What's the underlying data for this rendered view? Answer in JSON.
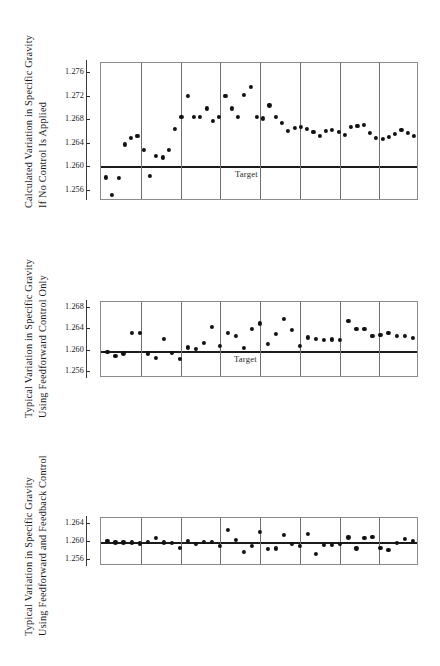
{
  "figure": {
    "background": "#ffffff",
    "ink": "#111111",
    "frame_color": "#8b8b8b",
    "panel_divider_color": "#6e6e6e",
    "target_line_color": "#1b1b1b"
  },
  "charts": [
    {
      "id": "chart-no-control",
      "axis_label_line1": "Calculated Variation in Specific Gravity",
      "axis_label_line2": "If No Control Is Applied",
      "target_label": "Target",
      "ticks": [
        "1.276",
        "1.272",
        "1.268",
        "1.264",
        "1.260",
        "1.256"
      ],
      "chart_data": {
        "type": "scatter",
        "title": "",
        "xlabel": "",
        "ylabel": "Calculated Variation in Specific Gravity If No Control Is Applied",
        "ylim": [
          1.2543,
          1.2777
        ],
        "yticks": [
          1.276,
          1.272,
          1.268,
          1.264,
          1.26,
          1.256
        ],
        "grid": false,
        "legend": "none",
        "panels": 8,
        "target": 1.26,
        "annotations": [
          "Target"
        ],
        "x": [
          1,
          2,
          3,
          4,
          5,
          6,
          7,
          8,
          9,
          10,
          11,
          12,
          13,
          14,
          15,
          16,
          17,
          18,
          19,
          20,
          21,
          22,
          23,
          24,
          25,
          26,
          27,
          28,
          29,
          30,
          31,
          32,
          33,
          34,
          35,
          36,
          37,
          38,
          39,
          40,
          41,
          42,
          43,
          44,
          45,
          46,
          47,
          48,
          49,
          50
        ],
        "values": [
          1.2583,
          1.2553,
          1.2582,
          1.2639,
          1.265,
          1.2654,
          1.263,
          1.2585,
          1.2619,
          1.2617,
          1.263,
          1.2665,
          1.2686,
          1.2721,
          1.2685,
          1.2686,
          1.27,
          1.2679,
          1.2686,
          1.2721,
          1.27,
          1.2685,
          1.2723,
          1.2737,
          1.2686,
          1.2683,
          1.2705,
          1.2685,
          1.2675,
          1.2662,
          1.2667,
          1.2668,
          1.2665,
          1.266,
          1.2653,
          1.2662,
          1.2663,
          1.266,
          1.2655,
          1.2668,
          1.267,
          1.2672,
          1.2658,
          1.265,
          1.2648,
          1.2652,
          1.2657,
          1.2664,
          1.2659,
          1.2654
        ]
      }
    },
    {
      "id": "chart-feedforward-only",
      "axis_label_line1": "Typical Variation in Specific Gravity",
      "axis_label_line2": "Using Feedforward Control Only",
      "target_label": "Target",
      "ticks": [
        "1.268",
        "1.264",
        "1.260",
        "1.256"
      ],
      "chart_data": {
        "type": "scatter",
        "title": "",
        "xlabel": "",
        "ylabel": "Typical Variation in Specific Gravity Using Feedforward Control Only",
        "ylim": [
          1.2549,
          1.2691
        ],
        "yticks": [
          1.268,
          1.264,
          1.26,
          1.256
        ],
        "grid": false,
        "legend": "none",
        "panels": 8,
        "target": 1.2597,
        "annotations": [
          "Target"
        ],
        "x": [
          1,
          2,
          3,
          4,
          5,
          6,
          7,
          8,
          9,
          10,
          11,
          12,
          13,
          14,
          15,
          16,
          17,
          18,
          19,
          20,
          21,
          22,
          23,
          24,
          25,
          26,
          27,
          28,
          29,
          30,
          31,
          32,
          33,
          34,
          35,
          36,
          37,
          38,
          39,
          40,
          41,
          42,
          43,
          44,
          45,
          46,
          47,
          48,
          49,
          50
        ],
        "values": [
          1.2597,
          1.2591,
          1.2595,
          1.2633,
          1.2634,
          1.2595,
          1.2587,
          1.2622,
          1.2596,
          1.2584,
          1.2606,
          1.2604,
          1.2615,
          1.2645,
          1.2609,
          1.2633,
          1.2627,
          1.2605,
          1.264,
          1.2651,
          1.2613,
          1.2632,
          1.266,
          1.2639,
          1.2609,
          1.2625,
          1.2622,
          1.262,
          1.2621,
          1.262,
          1.2655,
          1.264,
          1.264,
          1.2627,
          1.2629,
          1.2633,
          1.2628,
          1.2627,
          1.2624
        ]
      }
    },
    {
      "id": "chart-feedforward-feedback",
      "axis_label_line1": "Typical Variation in Specific Gravity",
      "axis_label_line2": "Using Feedforward and Feedback Control",
      "target_label": "",
      "ticks": [
        "1.264",
        "1.260",
        "1.256"
      ],
      "chart_data": {
        "type": "scatter",
        "title": "",
        "xlabel": "",
        "ylabel": "Typical Variation in Specific Gravity Using Feedforward and Feedback Control",
        "ylim": [
          1.2548,
          1.2652
        ],
        "yticks": [
          1.264,
          1.26,
          1.256
        ],
        "grid": false,
        "legend": "none",
        "panels": 8,
        "target": 1.2598,
        "annotations": [],
        "x": [
          1,
          2,
          3,
          4,
          5,
          6,
          7,
          8,
          9,
          10,
          11,
          12,
          13,
          14,
          15,
          16,
          17,
          18,
          19,
          20,
          21,
          22,
          23,
          24,
          25,
          26,
          27,
          28,
          29,
          30,
          31,
          32,
          33,
          34,
          35,
          36,
          37,
          38,
          39,
          40,
          41,
          42,
          43,
          44,
          45,
          46,
          47,
          48
        ],
        "values": [
          1.2602,
          1.2599,
          1.2599,
          1.2599,
          1.2597,
          1.26,
          1.2608,
          1.2599,
          1.2598,
          1.2588,
          1.2602,
          1.2596,
          1.2601,
          1.2601,
          1.2592,
          1.2626,
          1.2604,
          1.2578,
          1.2591,
          1.2622,
          1.2585,
          1.2586,
          1.2615,
          1.2596,
          1.2592,
          1.2617,
          1.2575,
          1.2594,
          1.2594,
          1.2595,
          1.261,
          1.2586,
          1.2609,
          1.2611,
          1.2588,
          1.2582,
          1.2598,
          1.2607,
          1.2602
        ]
      }
    }
  ]
}
